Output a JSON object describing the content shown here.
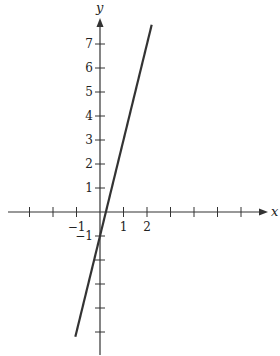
{
  "chart_data": {
    "type": "line",
    "title": "",
    "xlabel": "x",
    "ylabel": "y",
    "xlim": [
      -3.0,
      6.9
    ],
    "ylim": [
      -6.0,
      8.0
    ],
    "grid": false,
    "x_ticks": [
      -3,
      -2,
      -1,
      1,
      2,
      3,
      4,
      5,
      6
    ],
    "x_tick_labels": [
      {
        "value": -1,
        "label": "−1"
      },
      {
        "value": 1,
        "label": "1"
      },
      {
        "value": 2,
        "label": "2"
      }
    ],
    "y_ticks": [
      -5,
      -4,
      -3,
      -2,
      -1,
      1,
      2,
      3,
      4,
      5,
      6,
      7
    ],
    "y_tick_labels": [
      {
        "value": -1,
        "label": "−1"
      },
      {
        "value": 1,
        "label": "1"
      },
      {
        "value": 2,
        "label": "2"
      },
      {
        "value": 3,
        "label": "3"
      },
      {
        "value": 4,
        "label": "4"
      },
      {
        "value": 5,
        "label": "5"
      },
      {
        "value": 6,
        "label": "6"
      },
      {
        "value": 7,
        "label": "7"
      }
    ],
    "series": [
      {
        "name": "y = 4x - 1",
        "slope": 4,
        "intercept": -1,
        "x": [
          -1.05,
          2.2
        ],
        "y": [
          -5.2,
          7.8
        ],
        "color": "#333333"
      }
    ]
  },
  "axes": {
    "x_name": "x",
    "y_name": "y"
  }
}
